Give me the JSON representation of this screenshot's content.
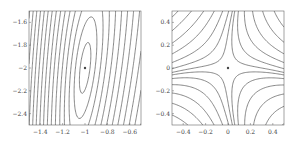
{
  "chart_data": [
    {
      "type": "contour",
      "title": "",
      "xlabel": "",
      "ylabel": "",
      "xlim": [
        -1.5,
        -0.5
      ],
      "ylim": [
        -2.5,
        -1.5
      ],
      "x_ticks": [
        "-1.4",
        "-1.2",
        "-1",
        "-0.8",
        "-0.6"
      ],
      "y_ticks": [
        "-1.6",
        "-1.8",
        "-2",
        "-2.2",
        "-2.4"
      ],
      "critical_point": {
        "x": -1,
        "y": -2,
        "kind": "minimum"
      },
      "description": "Tilted elliptical contours around a minimum at (-1,-2), dense contour lines toward the left edge",
      "grid": false
    },
    {
      "type": "contour",
      "title": "",
      "xlabel": "",
      "ylabel": "",
      "xlim": [
        -0.5,
        0.5
      ],
      "ylim": [
        -0.5,
        0.5
      ],
      "x_ticks": [
        "-0.4",
        "-0.2",
        "0",
        "0.2",
        "0.4"
      ],
      "y_ticks": [
        "0.4",
        "0.2",
        "0",
        "-0.2",
        "-0.4"
      ],
      "critical_point": {
        "x": 0,
        "y": 0,
        "kind": "saddle"
      },
      "description": "Hyperbolic saddle-point contours centered at (0,0), dense lines toward top-left and bottom-right corners",
      "grid": false
    }
  ],
  "left_plot": {
    "x_ticks": [
      "-1.4",
      "-1.2",
      "-1",
      "-0.8",
      "-0.6"
    ],
    "y_ticks": [
      "-1.6",
      "-1.8",
      "-2",
      "-2.2",
      "-2.4"
    ]
  },
  "right_plot": {
    "x_ticks": [
      "-0.4",
      "-0.2",
      "0",
      "0.2",
      "0.4"
    ],
    "y_ticks": [
      "0.4",
      "0.2",
      "0",
      "-0.2",
      "-0.4"
    ]
  }
}
